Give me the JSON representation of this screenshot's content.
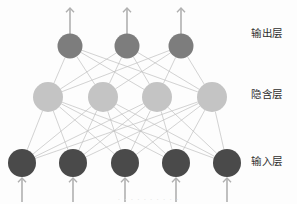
{
  "diagram": {
    "background_color": "#fdfdfd",
    "edge_color": "#b9b9b9",
    "arrow_color": "#b0b0b0",
    "labels": {
      "output": "输出层",
      "hidden": "隐含层",
      "input": "输入层",
      "label_color": "#2e2e2e"
    },
    "watermark": "· · · · · · · · · ·",
    "layers": [
      {
        "name": "output",
        "label": "输出层",
        "node_count": 3,
        "node_color": "#7d7d7d",
        "node_radius": 12.5,
        "y": 46,
        "x_positions": [
          70,
          127,
          181
        ],
        "has_outgoing_arrows": true,
        "has_incoming_arrows": false
      },
      {
        "name": "hidden",
        "label": "隐含层",
        "node_count": 4,
        "node_color": "#c4c4c4",
        "node_radius": 15,
        "y": 97,
        "x_positions": [
          48,
          103,
          157,
          212
        ],
        "has_outgoing_arrows": false,
        "has_incoming_arrows": false
      },
      {
        "name": "input",
        "label": "输入层",
        "node_count": 5,
        "node_color": "#4a4a4a",
        "node_radius": 14,
        "y": 163,
        "x_positions": [
          22,
          73,
          125,
          176,
          227
        ],
        "has_outgoing_arrows": false,
        "has_incoming_arrows": true
      }
    ],
    "connections": [
      {
        "from": "input",
        "to": "hidden",
        "fully_connected": true,
        "count": 20
      },
      {
        "from": "hidden",
        "to": "output",
        "fully_connected": true,
        "count": 12
      }
    ],
    "output_arrows": {
      "count": 3,
      "direction": "up",
      "top_y": 8,
      "bottom_y": 34
    },
    "input_arrows": {
      "count": 5,
      "direction": "up",
      "top_y": 178,
      "bottom_y": 202
    }
  }
}
